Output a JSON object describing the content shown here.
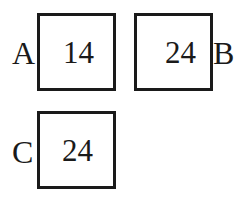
{
  "boxes": [
    {
      "label": "A",
      "value": "14"
    },
    {
      "label": "B",
      "value": "24"
    },
    {
      "label": "C",
      "value": "24"
    }
  ]
}
